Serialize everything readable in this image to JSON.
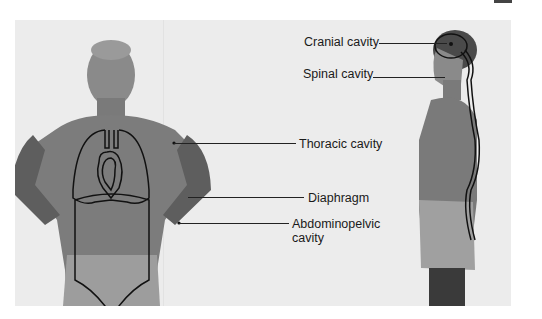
{
  "figure": {
    "type": "anatomical-diagram",
    "views": [
      "anterior",
      "lateral"
    ]
  },
  "labels": {
    "cranial": "Cranial cavity",
    "spinal": "Spinal cavity",
    "thoracic": "Thoracic cavity",
    "diaphragm": "Diaphragm",
    "abdominopelvic_line1": "Abdominopelvic",
    "abdominopelvic_line2": "cavity"
  },
  "colors": {
    "background": "#ececec",
    "outline": "#111111",
    "text": "#1a1a1a"
  }
}
